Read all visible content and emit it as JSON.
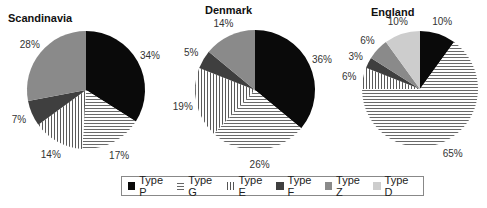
{
  "chart_data": [
    {
      "type": "pie",
      "title": "Scandinavia",
      "categories": [
        "Type P",
        "Type G",
        "Type E",
        "Type F",
        "Type Z",
        "Type D"
      ],
      "values": [
        34,
        17,
        14,
        7,
        28,
        0
      ],
      "labels": [
        "34%",
        "17%",
        "14%",
        "7%",
        "28%",
        ""
      ]
    },
    {
      "type": "pie",
      "title": "Denmark",
      "categories": [
        "Type P",
        "Type G",
        "Type E",
        "Type F",
        "Type Z",
        "Type D"
      ],
      "values": [
        36,
        26,
        19,
        5,
        14,
        0
      ],
      "labels": [
        "36%",
        "26%",
        "19%",
        "5%",
        "14%",
        ""
      ]
    },
    {
      "type": "pie",
      "title": "England",
      "categories": [
        "Type P",
        "Type G",
        "Type E",
        "Type F",
        "Type Z",
        "Type D"
      ],
      "values": [
        10,
        65,
        6,
        3,
        6,
        10
      ],
      "labels": [
        "10%",
        "65%",
        "6%",
        "3%",
        "6%",
        "10%"
      ]
    }
  ],
  "legend": {
    "position": "bottom-center",
    "items": [
      {
        "label": "Type P",
        "fill": "solid-black",
        "color": "#0a0a0a"
      },
      {
        "label": "Type G",
        "fill": "horizontal-lines",
        "color": "#666666"
      },
      {
        "label": "Type E",
        "fill": "vertical-lines",
        "color": "#555555"
      },
      {
        "label": "Type F",
        "fill": "solid-dark-gray",
        "color": "#3f3f3f"
      },
      {
        "label": "Type Z",
        "fill": "solid-mid-gray",
        "color": "#8a8a8a"
      },
      {
        "label": "Type D",
        "fill": "solid-light-gray",
        "color": "#cdcdcd"
      }
    ]
  },
  "titles": {
    "scandinavia": "Scandinavia",
    "denmark": "Denmark",
    "england": "England"
  }
}
